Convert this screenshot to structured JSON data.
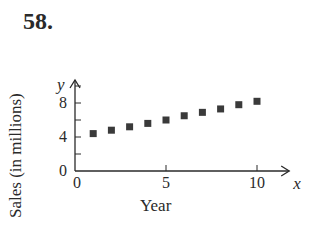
{
  "problem": {
    "number": "58."
  },
  "chart_data": {
    "type": "scatter",
    "title": "",
    "xlabel": "Year",
    "ylabel": "Sales (in millions)",
    "x_axis_var": "x",
    "y_axis_var": "y",
    "xlim": [
      0,
      11
    ],
    "ylim": [
      0,
      10
    ],
    "x_ticks": [
      0,
      5,
      10
    ],
    "x_tick_labels": [
      "0",
      "5",
      "10"
    ],
    "y_ticks": [
      0,
      2,
      4,
      6,
      8,
      10
    ],
    "y_tick_labels": [
      "0",
      "4",
      "8"
    ],
    "grid": false,
    "marker": "square",
    "series": [
      {
        "name": "Sales",
        "x": [
          1,
          2,
          3,
          4,
          5,
          6,
          7,
          8,
          9,
          10
        ],
        "y": [
          4.4,
          4.8,
          5.2,
          5.6,
          6.0,
          6.5,
          6.9,
          7.3,
          7.8,
          8.2
        ]
      }
    ]
  }
}
